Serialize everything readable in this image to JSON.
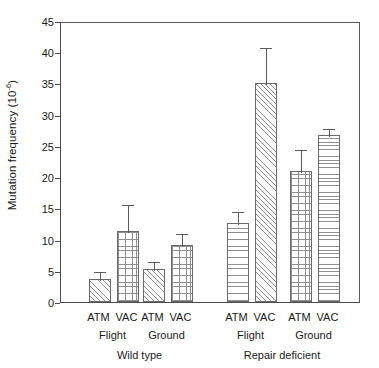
{
  "chart_data": {
    "type": "bar",
    "title": "",
    "xlabel": "",
    "ylabel": "Mutation frequency (10",
    "ylabel_exponent": "-6",
    "ylabel_suffix": ")",
    "ylim": [
      0,
      45
    ],
    "ytick_labels": [
      "0",
      "5",
      "10",
      "15",
      "20",
      "25",
      "30",
      "35",
      "40",
      "45"
    ],
    "ytick_values": [
      0,
      5,
      10,
      15,
      20,
      25,
      30,
      35,
      40,
      45
    ],
    "grid": false,
    "legend": "none",
    "categories": [
      "ATM",
      "VAC",
      "ATM",
      "VAC",
      "ATM",
      "VAC",
      "ATM",
      "VAC"
    ],
    "values": [
      3.7,
      11.3,
      5.3,
      9.2,
      12.6,
      35.1,
      21.0,
      26.8
    ],
    "errors": [
      1.4,
      4.5,
      1.5,
      2.0,
      2.1,
      5.9,
      3.7,
      1.2
    ],
    "patterns": [
      "diagonal",
      "grid",
      "diagonal",
      "grid",
      "horizontal",
      "diagonal",
      "grid",
      "horizontal"
    ],
    "group_labels_level1": [
      "Flight",
      "Ground",
      "Flight",
      "Ground"
    ],
    "group_labels_level2": [
      "Wild type",
      "Repair deficient"
    ],
    "bar_color": "#ffffff",
    "bar_edge_color": "#6a6a6a",
    "hatch_color": "#8e8e8e",
    "axis_color": "#4c4c4c"
  },
  "axis": {
    "y_title_text": "Mutation frequency (10",
    "y_title_exp": "-6",
    "y_title_end": ")"
  }
}
